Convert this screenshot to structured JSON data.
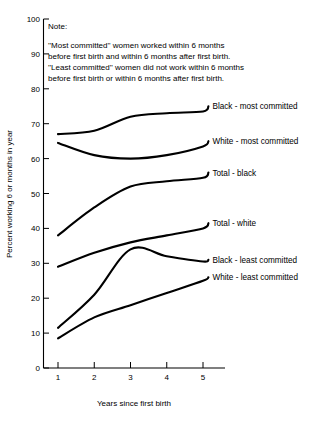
{
  "note": {
    "heading": "Note:",
    "lines": [
      "''Most committed'' women worked within 6 months",
      "before first birth and within 6 months after first birth.",
      "''Least committed'' women did not work within 6 months",
      "before first birth or within 6 months after first birth."
    ]
  },
  "chart_data": {
    "type": "line",
    "title": "",
    "xlabel": "Years since first birth",
    "ylabel": "Percent working 6 or months in year",
    "x": [
      1,
      2,
      3,
      4,
      5
    ],
    "xlim": [
      0.5,
      5.6
    ],
    "ylim": [
      0,
      100
    ],
    "xticks": [
      1,
      2,
      3,
      4,
      5
    ],
    "yticks": [
      0,
      10,
      20,
      30,
      40,
      50,
      60,
      70,
      80,
      90,
      100
    ],
    "xtick_labels": [
      "1",
      "2",
      "3",
      "4",
      "5"
    ],
    "ytick_labels": [
      "0",
      "10",
      "20",
      "30",
      "40",
      "50",
      "60",
      "70",
      "80",
      "90",
      "100"
    ],
    "grid": false,
    "legend_position": "inline-right",
    "series": [
      {
        "name": "Black - most committed",
        "values": [
          67.0,
          68.0,
          72.0,
          73.0,
          73.5
        ],
        "label_x": 5.15,
        "label_y": 75.0
      },
      {
        "name": "White - most committed",
        "values": [
          64.5,
          61.0,
          60.0,
          61.0,
          63.5
        ],
        "label_x": 5.15,
        "label_y": 65.0
      },
      {
        "name": "Total - black",
        "values": [
          38.0,
          46.0,
          52.0,
          53.5,
          54.5
        ],
        "label_x": 5.15,
        "label_y": 56.0
      },
      {
        "name": "Total - white",
        "values": [
          29.0,
          33.0,
          36.0,
          38.0,
          40.0
        ],
        "label_x": 5.15,
        "label_y": 41.5
      },
      {
        "name": "Black - least committed",
        "values": [
          11.5,
          21.0,
          34.0,
          32.0,
          30.5
        ],
        "label_x": 5.15,
        "label_y": 31.0
      },
      {
        "name": "White - least committed",
        "values": [
          8.5,
          14.5,
          18.0,
          21.5,
          25.0
        ],
        "label_x": 5.15,
        "label_y": 26.0
      }
    ]
  }
}
